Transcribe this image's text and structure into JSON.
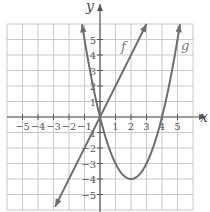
{
  "chart_data": {
    "type": "line",
    "title": "",
    "xlabel": "x",
    "ylabel": "y",
    "xlim": [
      -6,
      6
    ],
    "ylim": [
      -6,
      6
    ],
    "grid": true,
    "x_ticks": [
      -5,
      -4,
      -3,
      -2,
      -1,
      1,
      2,
      3,
      4,
      5
    ],
    "y_ticks": [
      -5,
      -4,
      -3,
      -2,
      -1,
      1,
      2,
      3,
      4,
      5
    ],
    "x_tick_labels": [
      "−5",
      "−4",
      "−3",
      "−2",
      "−1",
      "1",
      "2",
      "3",
      "4",
      "5"
    ],
    "y_tick_labels": [
      "−5",
      "−4",
      "−3",
      "−2",
      "1",
      "1",
      "2",
      "3",
      "4",
      "5"
    ],
    "series": [
      {
        "name": "f",
        "expression": "f(x) = 2x",
        "kind": "line",
        "x": [
          -2.9,
          -2,
          -1,
          0,
          1,
          2,
          3
        ],
        "y": [
          -5.8,
          -4,
          -2,
          0,
          2,
          4,
          6
        ],
        "arrows": "both"
      },
      {
        "name": "g",
        "expression": "g(x) = x^2 - 4x",
        "kind": "parabola",
        "x": [
          -1.16,
          -1,
          0,
          1,
          2,
          3,
          4,
          5,
          5.16
        ],
        "y": [
          6,
          5,
          0,
          -3,
          -4,
          -3,
          0,
          5,
          6
        ],
        "vertex": [
          2,
          -4
        ],
        "zeros": [
          0,
          4
        ],
        "arrows": "both"
      }
    ],
    "legend": []
  },
  "labels": {
    "x_axis": "x",
    "y_axis": "y",
    "f": "f",
    "g": "g"
  },
  "colors": {
    "grid": "#c8c8c8",
    "axis": "#555555",
    "curve": "#6e6e6e"
  }
}
